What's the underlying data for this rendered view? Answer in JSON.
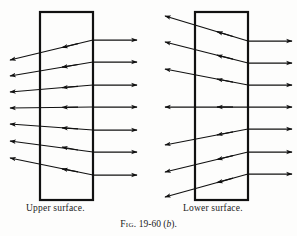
{
  "figure": {
    "caption_prefix": "Fig.",
    "caption_number": "19-60",
    "caption_part_open": "(",
    "caption_part": "b",
    "caption_part_close": ").",
    "caption_full": "Fig. 19-60 (b).",
    "stroke_color": "#111111",
    "background_color": "#fdfdfc",
    "slab_stroke_width": "2.2",
    "ray_stroke_width": "1.25"
  },
  "panels": [
    {
      "id": "upper-surface",
      "label": "Upper surface.",
      "slab": {
        "x": 40,
        "y": 12,
        "width": 53,
        "height": 188
      },
      "incoming_ray_count": 7,
      "exit_ray_count": 7,
      "ray_pattern": "converging",
      "incoming_entry_x": 137,
      "incoming_y": [
        40,
        62,
        85,
        107,
        130,
        152,
        175
      ],
      "exit_tip_x": 10,
      "exit_y": [
        60,
        76,
        92,
        108,
        124,
        141,
        158
      ]
    },
    {
      "id": "lower-surface",
      "label": "Lower surface.",
      "slab": {
        "x": 195,
        "y": 12,
        "width": 53,
        "height": 188
      },
      "incoming_ray_count": 7,
      "exit_ray_count": 7,
      "ray_pattern": "diverging",
      "incoming_entry_x": 292,
      "incoming_y": [
        41,
        63,
        85,
        107,
        129,
        152,
        174
      ],
      "exit_tip_x": 165,
      "exit_y": [
        16,
        42,
        69,
        107,
        145,
        172,
        197
      ]
    }
  ]
}
